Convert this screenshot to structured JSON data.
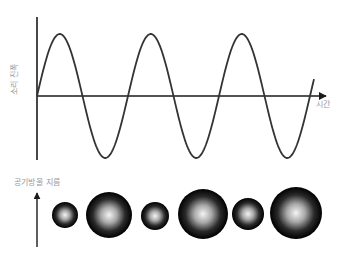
{
  "diagram": {
    "top_panel": {
      "y_axis_label": "소리 진폭",
      "x_axis_label": "시간",
      "wave": {
        "type": "sine",
        "origin": [
          37,
          96
        ],
        "amplitude_px": 62,
        "period_px": 91,
        "x_start": 37,
        "x_end": 314,
        "stroke": "#333333"
      }
    },
    "bottom_panel": {
      "axis_label": "공기방울 지름",
      "bubbles": [
        {
          "cx": 65,
          "cy": 215,
          "r": 13,
          "size": "small"
        },
        {
          "cx": 109,
          "cy": 215,
          "r": 23,
          "size": "large"
        },
        {
          "cx": 155,
          "cy": 216,
          "r": 14,
          "size": "small"
        },
        {
          "cx": 203,
          "cy": 214,
          "r": 25,
          "size": "large"
        },
        {
          "cx": 248,
          "cy": 214,
          "r": 16,
          "size": "small"
        },
        {
          "cx": 296,
          "cy": 213,
          "r": 26,
          "size": "large"
        }
      ]
    },
    "colors": {
      "axis": "#1a1a1a",
      "wave": "#333333",
      "label": "#9a9a9a",
      "bubble_edge": "#000000",
      "bubble_center": "#f2f2f2"
    }
  }
}
